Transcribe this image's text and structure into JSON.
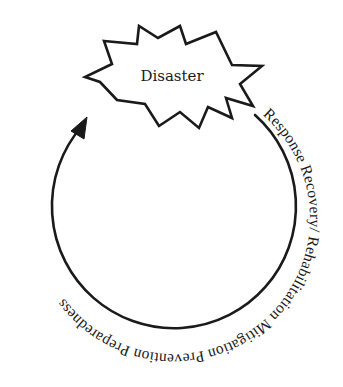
{
  "diagram": {
    "center": {
      "label": "Disaster",
      "shape": "starburst"
    },
    "cycle": {
      "direction": "clockwise",
      "arrow": "arrowhead at upper-left pointing into the Disaster starburst",
      "ring_text": "Response Recovery/ Rehabilitation Mitigation Prevention Preparedness",
      "phases": [
        {
          "label": "Response"
        },
        {
          "label": "Recovery/"
        },
        {
          "label": "Rehabilitation"
        },
        {
          "label": "Mitigation"
        },
        {
          "label": "Prevention"
        },
        {
          "label": "Preparedness"
        }
      ]
    },
    "colors": {
      "stroke": "#1a1a1a",
      "background": "#ffffff",
      "text": "#1a1a1a"
    }
  }
}
